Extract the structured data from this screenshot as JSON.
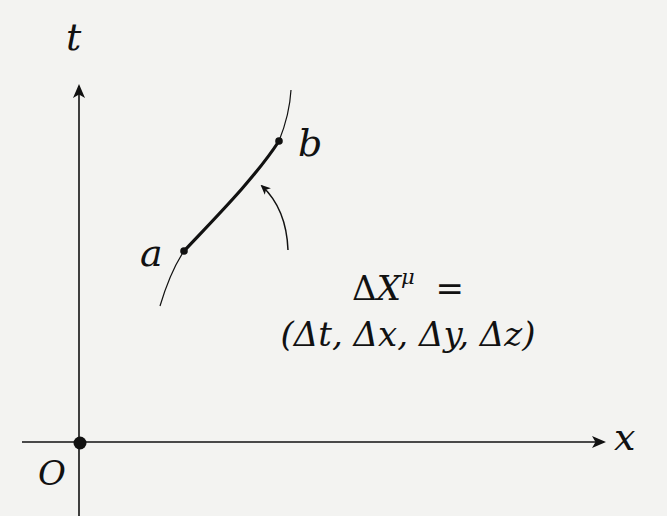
{
  "diagram": {
    "type": "spacetime-diagram",
    "axes": {
      "vertical_label": "t",
      "horizontal_label": "x",
      "origin_label": "O"
    },
    "worldline": {
      "start_point_label": "a",
      "end_point_label": "b"
    },
    "formula": {
      "line1_lhs_delta": "Δ",
      "line1_lhs_var": "X",
      "line1_superscript": "μ",
      "line1_equals": "=",
      "line2": "(Δt, Δx, Δy, Δz)"
    },
    "colors": {
      "background": "#f3f3f1",
      "ink": "#111111"
    }
  }
}
